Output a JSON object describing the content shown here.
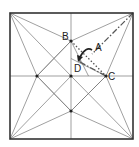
{
  "diagram": {
    "type": "origami-crease-pattern",
    "square": {
      "x1": 10,
      "y1": 13,
      "x2": 133,
      "y2": 139
    },
    "colors": {
      "border": "#333333",
      "crease": "#777777",
      "fold": "#555555",
      "label": "#222222"
    },
    "points": {
      "TL": [
        10,
        13
      ],
      "TR": [
        133,
        13
      ],
      "BL": [
        10,
        139
      ],
      "BR": [
        133,
        139
      ],
      "O": [
        71,
        76
      ],
      "B": [
        71,
        41
      ],
      "C": [
        106,
        76
      ],
      "L": [
        37,
        76
      ],
      "S": [
        71,
        111
      ],
      "D": [
        80,
        62
      ],
      "A": [
        92,
        54
      ]
    },
    "labels": [
      {
        "id": "label-b",
        "text": "B",
        "x": 62,
        "y": 40
      },
      {
        "id": "label-a",
        "text": "A",
        "x": 95,
        "y": 51
      },
      {
        "id": "label-d",
        "text": "D",
        "x": 74,
        "y": 72
      },
      {
        "id": "label-c",
        "text": "C",
        "x": 108,
        "y": 80
      }
    ]
  }
}
